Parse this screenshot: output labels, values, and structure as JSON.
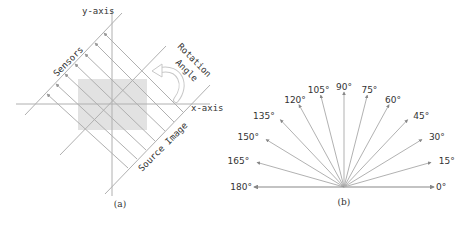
{
  "panel_a": {
    "caption": "(a)",
    "labels": {
      "y_axis": "y-axis",
      "x_axis": "x-axis",
      "sensors": "Sensors",
      "rotation": "Rotation",
      "angle": "Angle",
      "source_image": "Source Image"
    },
    "colors": {
      "line": "#b0b0b0",
      "rect": "#e2e2e2",
      "text": "#333333"
    }
  },
  "panel_b": {
    "caption": "(b)",
    "angles": [
      "0°",
      "15°",
      "30°",
      "45°",
      "60°",
      "75°",
      "90°",
      "105°",
      "120°",
      "135°",
      "150°",
      "165°",
      "180°"
    ],
    "colors": {
      "line": "#a8a8a8",
      "text": "#333333"
    }
  }
}
